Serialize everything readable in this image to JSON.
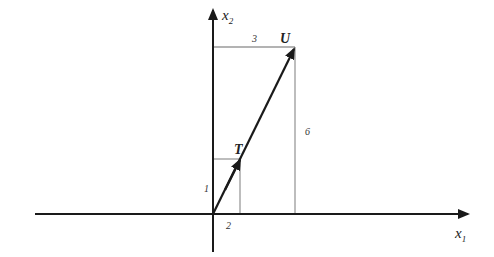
{
  "diagram": {
    "type": "vector-addition-plot",
    "axes": {
      "x_label": "x",
      "x_sub": "1",
      "y_label": "x",
      "y_sub": "2"
    },
    "vectors": [
      {
        "name": "T",
        "components": [
          2,
          1
        ]
      },
      {
        "name": "U",
        "components": [
          3,
          6
        ]
      }
    ],
    "annotations": {
      "t_horizontal": "2",
      "t_vertical": "1",
      "u_horizontal": "3",
      "u_vertical": "6"
    },
    "colors": {
      "axis": "#1a1a1a",
      "vector": "#1a1a1a",
      "guide": "#9a9a9a"
    }
  }
}
